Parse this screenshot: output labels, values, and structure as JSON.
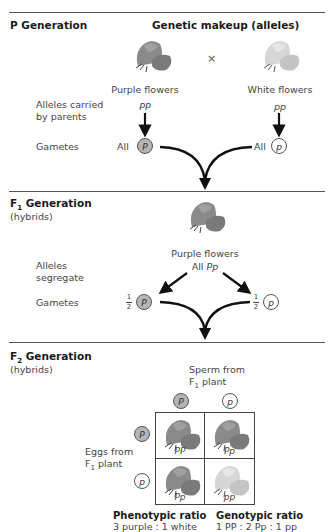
{
  "p_generation": {
    "heading": "P Generation",
    "column_heading": "Genetic makeup (alleles)",
    "cross_symbol": "×",
    "parent_left": {
      "phenotype": "Purple flowers",
      "genotype": "PP",
      "gamete_prefix": "All",
      "gamete": "P"
    },
    "parent_right": {
      "phenotype": "White flowers",
      "genotype": "pp",
      "gamete_prefix": "All",
      "gamete": "p"
    },
    "row_labels": {
      "alleles": "Alleles carried",
      "alleles2": "by parents",
      "gametes": "Gametes"
    }
  },
  "f1_generation": {
    "heading": "F",
    "heading_sub": "1",
    "heading_rest": " Generation",
    "subheading": "(hybrids)",
    "phenotype": "Purple flowers",
    "genotype_prefix": "All ",
    "genotype": "Pp",
    "row_labels": {
      "segregate1": "Alleles",
      "segregate2": "segregate",
      "gametes": "Gametes"
    },
    "gamete_left": {
      "fraction_num": "1",
      "fraction_den": "2",
      "allele": "P"
    },
    "gamete_right": {
      "fraction_num": "1",
      "fraction_den": "2",
      "allele": "p"
    }
  },
  "f2_generation": {
    "heading": "F",
    "heading_sub": "2",
    "heading_rest": " Generation",
    "subheading": "(hybrids)",
    "sperm_label1": "Sperm from",
    "sperm_label2_pre": "F",
    "sperm_label2_sub": "1",
    "sperm_label2_post": " plant",
    "eggs_label1": "Eggs from",
    "eggs_label2_pre": "F",
    "eggs_label2_sub": "1",
    "eggs_label2_post": " plant",
    "sperm_alleles": [
      "P",
      "p"
    ],
    "egg_alleles": [
      "P",
      "p"
    ],
    "punnett": [
      {
        "genotype": "PP",
        "color": "purple"
      },
      {
        "genotype": "Pp",
        "color": "purple"
      },
      {
        "genotype": "Pp",
        "color": "purple"
      },
      {
        "genotype": "pp",
        "color": "white"
      }
    ],
    "phenotypic_ratio": {
      "title": "Phenotypic ratio",
      "value": "3 purple : 1 white"
    },
    "genotypic_ratio": {
      "title": "Genotypic ratio",
      "value": "1 PP : 2 Pp : 1 pp"
    }
  },
  "colors": {
    "purple_flower": "#7d7d7d",
    "white_flower": "#d2d2d2",
    "dominant_allele": "#b5b5b5",
    "line": "#555555"
  }
}
